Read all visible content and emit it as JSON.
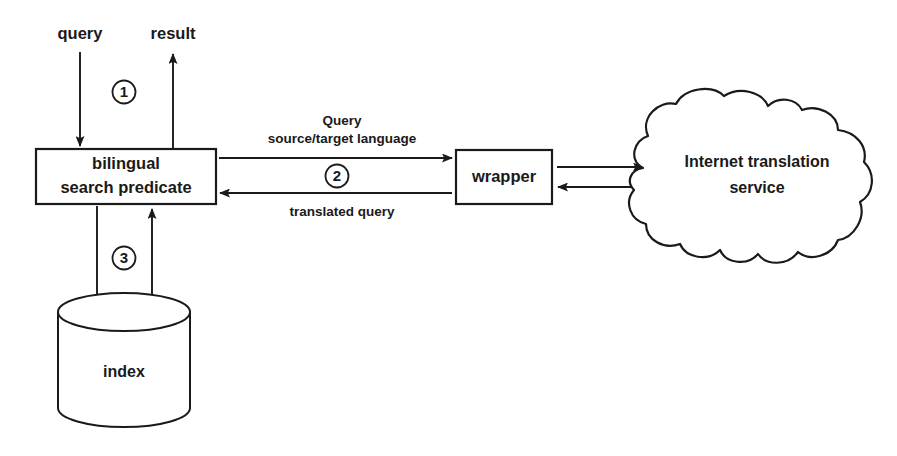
{
  "diagram": {
    "background_color": "#ffffff",
    "line_color": "#1a1a1a",
    "nodes": {
      "search_predicate": {
        "label_line1": "bilingual",
        "label_line2": "search predicate",
        "shape": "rectangle"
      },
      "wrapper": {
        "label": "wrapper",
        "shape": "rectangle"
      },
      "translation_service": {
        "label_line1": "Internet translation",
        "label_line2": "service",
        "shape": "cloud"
      },
      "index": {
        "label": "index",
        "shape": "cylinder"
      }
    },
    "io_labels": {
      "query": "query",
      "result": "result"
    },
    "edge_labels": {
      "query_out_line1": "Query",
      "query_out_line2": "source/target language",
      "translated_back": "translated query"
    },
    "step_markers": {
      "step1": "1",
      "step2": "2",
      "step3": "3"
    }
  }
}
